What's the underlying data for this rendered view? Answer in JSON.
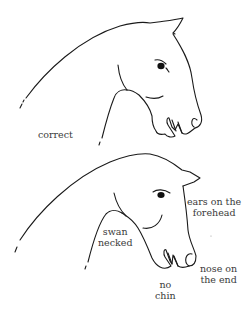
{
  "diagram": {
    "type": "comparison illustration",
    "colors": {
      "line": "#1a1a1a",
      "text": "#3a3a3a",
      "background": "#ffffff"
    },
    "figures": [
      {
        "id": "top",
        "label": "correct"
      },
      {
        "id": "bottom",
        "annotations": {
          "swan_line1": "swan",
          "swan_line2": "necked",
          "ears_line1": "ears on the",
          "ears_line2": "forehead",
          "nose_line1": "nose on",
          "nose_line2": "the end",
          "chin_line1": "no",
          "chin_line2": "chin"
        }
      }
    ]
  }
}
